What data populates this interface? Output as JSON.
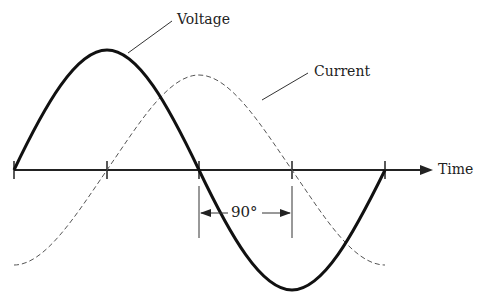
{
  "diagram": {
    "labels": {
      "voltage": "Voltage",
      "current": "Current",
      "time_axis": "Time",
      "phase_shift": "90°"
    },
    "axis": {
      "y": 170,
      "x_start": 14,
      "x_end": 420,
      "ticks_x": [
        14,
        107,
        199,
        292,
        385
      ]
    },
    "waves": {
      "voltage": {
        "style": "solid-thick",
        "amplitude_px": 120,
        "x_start": 14,
        "x_end": 385,
        "color": "#111111"
      },
      "current": {
        "style": "dashed",
        "amplitude_px": 95,
        "x_start": 14,
        "x_end": 385,
        "color": "#555555"
      }
    },
    "phase_marker": {
      "x1": 199,
      "x2": 292,
      "y": 215
    }
  }
}
